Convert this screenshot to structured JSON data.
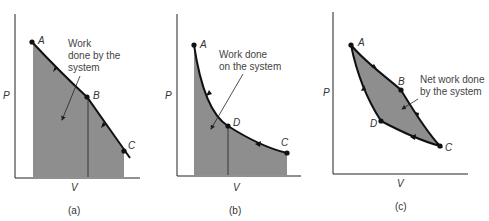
{
  "colors": {
    "fill": "#8e8e8e",
    "line": "#111111",
    "axis": "#222222",
    "text": "#333333",
    "background": "#ffffff"
  },
  "panels": [
    {
      "id": "a",
      "caption": "(a)",
      "x_axis_label": "V",
      "y_axis_label": "P",
      "points": [
        {
          "label": "A"
        },
        {
          "label": "B"
        },
        {
          "label": "C"
        }
      ],
      "annotation": [
        "Work",
        "done by the",
        "system"
      ]
    },
    {
      "id": "b",
      "caption": "(b)",
      "x_axis_label": "V",
      "y_axis_label": "P",
      "points": [
        {
          "label": "A"
        },
        {
          "label": "D"
        },
        {
          "label": "C"
        }
      ],
      "annotation": [
        "Work done",
        "on the system"
      ]
    },
    {
      "id": "c",
      "caption": "(c)",
      "x_axis_label": "V",
      "y_axis_label": "P",
      "points": [
        {
          "label": "A"
        },
        {
          "label": "B"
        },
        {
          "label": "C"
        },
        {
          "label": "D"
        }
      ],
      "annotation": [
        "Net work done",
        "by the system"
      ]
    }
  ]
}
